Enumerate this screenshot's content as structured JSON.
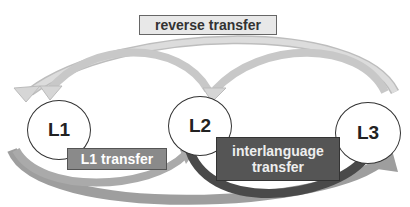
{
  "diagram": {
    "nodes": [
      {
        "id": "L1",
        "label": "L1"
      },
      {
        "id": "L2",
        "label": "L2"
      },
      {
        "id": "L3",
        "label": "L3"
      }
    ],
    "labels": {
      "reverse_transfer": "reverse transfer",
      "l1_transfer": "L1 transfer",
      "interlanguage_transfer_line1": "interlanguage",
      "interlanguage_transfer_line2": "transfer"
    },
    "edges": [
      {
        "from": "L3",
        "to": "L1",
        "type": "reverse transfer"
      },
      {
        "from": "L3",
        "to": "L2",
        "type": "reverse transfer"
      },
      {
        "from": "L2",
        "to": "L1",
        "type": "reverse transfer"
      },
      {
        "from": "L1",
        "to": "L2",
        "type": "L1 transfer"
      },
      {
        "from": "L1",
        "to": "L3",
        "type": "L1 transfer"
      },
      {
        "from": "L2",
        "to": "L3",
        "type": "interlanguage transfer"
      }
    ],
    "colors": {
      "reverse_box": "#e8e8e8",
      "l1_box": "#8a8a8a",
      "interlanguage_box": "#555555",
      "arrow_light": "#d0d0d0",
      "arrow_mid": "#9a9a9a",
      "arrow_dark": "#4a4a4a"
    }
  }
}
